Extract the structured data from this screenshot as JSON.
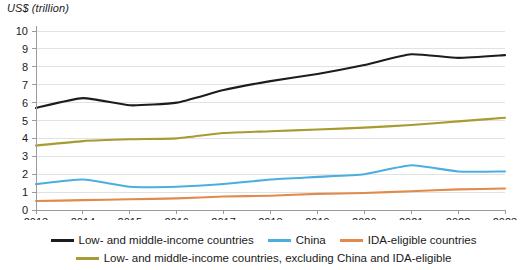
{
  "chart_data": {
    "type": "line",
    "title": "",
    "ylabel": "US$ (trillion)",
    "xlabel": "",
    "ylim": [
      0,
      10
    ],
    "yticks": [
      "0",
      "1",
      "2",
      "3",
      "4",
      "5",
      "6",
      "7",
      "8",
      "9",
      "10"
    ],
    "grid": true,
    "legend_position": "bottom",
    "x": [
      2013,
      2014,
      2015,
      2016,
      2017,
      2018,
      2019,
      2020,
      2021,
      2022,
      2023
    ],
    "categories": [
      "2013",
      "2014",
      "2015",
      "2016",
      "2017",
      "2018",
      "2019",
      "2020",
      "2021",
      "2022",
      "2023"
    ],
    "series": [
      {
        "name": "Low- and middle-income countries",
        "color": "#1c1c1c",
        "values": [
          5.7,
          6.25,
          5.85,
          6.0,
          6.7,
          7.2,
          7.6,
          8.1,
          8.7,
          8.5,
          8.65
        ]
      },
      {
        "name": "China",
        "color": "#4CAEE0",
        "values": [
          1.45,
          1.7,
          1.3,
          1.3,
          1.45,
          1.7,
          1.85,
          2.0,
          2.5,
          2.15,
          2.15
        ]
      },
      {
        "name": "IDA-eligible countries",
        "color": "#E08A4C",
        "values": [
          0.5,
          0.55,
          0.6,
          0.65,
          0.75,
          0.8,
          0.9,
          0.95,
          1.05,
          1.15,
          1.2
        ]
      },
      {
        "name": "Low- and middle-income countries, excluding China and IDA-eligible",
        "color": "#A89B32",
        "values": [
          3.6,
          3.85,
          3.95,
          4.0,
          4.3,
          4.4,
          4.5,
          4.6,
          4.75,
          4.95,
          5.15
        ]
      }
    ]
  },
  "axis": {
    "ylabel": "US$ (trillion)"
  },
  "legend": {
    "row1": [
      {
        "label": "Low- and middle-income countries",
        "color": "#1c1c1c"
      },
      {
        "label": "China",
        "color": "#4CAEE0"
      },
      {
        "label": "IDA-eligible countries",
        "color": "#E08A4C"
      }
    ],
    "row2": [
      {
        "label": "Low- and middle-income countries, excluding China and IDA-eligible",
        "color": "#A89B32"
      }
    ]
  }
}
